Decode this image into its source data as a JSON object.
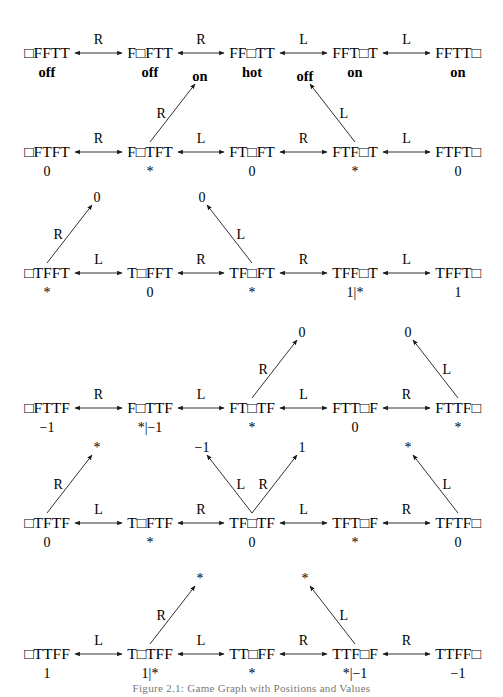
{
  "figure": {
    "caption": "Figure 2.1: Game Graph with Positions and Values"
  },
  "rows": [
    {
      "nodes": [
        {
          "label": "□FFTT",
          "value": "off",
          "bold": true
        },
        {
          "label": "F□FTT",
          "value": "off",
          "bold": true
        },
        {
          "label": "FF□TT",
          "value": "hot",
          "bold": true
        },
        {
          "label": "FFT□T",
          "value": "on",
          "bold": true
        },
        {
          "label": "FFTT□",
          "value": "on",
          "bold": true
        }
      ],
      "edges": [
        "R",
        "R",
        "L",
        "L"
      ],
      "branches": []
    },
    {
      "nodes": [
        {
          "label": "□FTFT",
          "value": "0"
        },
        {
          "label": "F□TFT",
          "value": "*"
        },
        {
          "label": "FT□FT",
          "value": "0"
        },
        {
          "label": "FTF□T",
          "value": "*"
        },
        {
          "label": "FTFT□",
          "value": "0"
        }
      ],
      "edges": [
        "R",
        "L",
        "R",
        "L"
      ],
      "branches": [
        {
          "from": 1,
          "dir": "right",
          "move": "R",
          "target": "on",
          "bold": true
        },
        {
          "from": 3,
          "dir": "left",
          "move": "L",
          "target": "off",
          "bold": true
        }
      ]
    },
    {
      "nodes": [
        {
          "label": "□TFFT",
          "value": "*"
        },
        {
          "label": "T□FFT",
          "value": "0"
        },
        {
          "label": "TF□FT",
          "value": "*"
        },
        {
          "label": "TFF□T",
          "value": "1|*"
        },
        {
          "label": "TFFT□",
          "value": "1"
        }
      ],
      "edges": [
        "L",
        "R",
        "R",
        "L"
      ],
      "branches": [
        {
          "from": 0,
          "dir": "right",
          "move": "R",
          "target": "0"
        },
        {
          "from": 2,
          "dir": "left",
          "move": "L",
          "target": "0"
        }
      ]
    },
    {
      "nodes": [
        {
          "label": "□FTTF",
          "value": "−1"
        },
        {
          "label": "F□TTF",
          "value": "*|−1"
        },
        {
          "label": "FT□TF",
          "value": "*"
        },
        {
          "label": "FTT□F",
          "value": "0"
        },
        {
          "label": "FTTF□",
          "value": "*"
        }
      ],
      "edges": [
        "R",
        "L",
        "L",
        "R"
      ],
      "branches": [
        {
          "from": 2,
          "dir": "right",
          "move": "R",
          "target": "0"
        },
        {
          "from": 4,
          "dir": "left",
          "move": "L",
          "target": "0"
        }
      ]
    },
    {
      "nodes": [
        {
          "label": "□TFTF",
          "value": "0"
        },
        {
          "label": "T□FTF",
          "value": "*"
        },
        {
          "label": "TF□TF",
          "value": "0"
        },
        {
          "label": "TFT□F",
          "value": "*"
        },
        {
          "label": "TFTF□",
          "value": "0"
        }
      ],
      "edges": [
        "L",
        "R",
        "L",
        "R"
      ],
      "branches": [
        {
          "from": 0,
          "dir": "right",
          "move": "R",
          "target": "*"
        },
        {
          "from": 2,
          "dir": "left",
          "move": "L",
          "target": "−1"
        },
        {
          "from": 2,
          "dir": "right",
          "move": "R",
          "target": "1"
        },
        {
          "from": 4,
          "dir": "left",
          "move": "L",
          "target": "*"
        }
      ]
    },
    {
      "nodes": [
        {
          "label": "□TTFF",
          "value": "1"
        },
        {
          "label": "T□TFF",
          "value": "1|*"
        },
        {
          "label": "TT□FF",
          "value": "*"
        },
        {
          "label": "TTF□F",
          "value": "*|−1"
        },
        {
          "label": "TTFF□",
          "value": "−1"
        }
      ],
      "edges": [
        "L",
        "L",
        "R",
        "R"
      ],
      "branches": [
        {
          "from": 1,
          "dir": "right",
          "move": "R",
          "target": "*"
        },
        {
          "from": 3,
          "dir": "left",
          "move": "L",
          "target": "*"
        }
      ]
    }
  ]
}
